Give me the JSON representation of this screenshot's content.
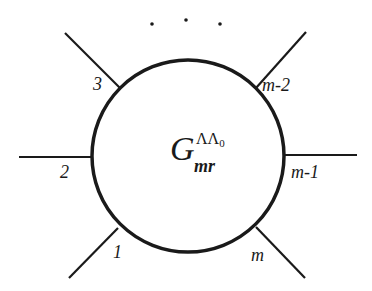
{
  "diagram": {
    "type": "vertex-diagram",
    "center_symbol": {
      "base": "G",
      "superscript_main": "ΛΛ",
      "superscript_index": "0",
      "subscript": "mr"
    },
    "ellipsis": "· · ·",
    "legs": [
      {
        "label": "1",
        "position": "bottom-left"
      },
      {
        "label": "2",
        "position": "left"
      },
      {
        "label": "3",
        "position": "top-left"
      },
      {
        "label": "m-2",
        "position": "top-right"
      },
      {
        "label": "m-1",
        "position": "right"
      },
      {
        "label": "m",
        "position": "bottom-right"
      }
    ],
    "stroke_color": "#1a1a1a",
    "background_color": "#ffffff"
  }
}
